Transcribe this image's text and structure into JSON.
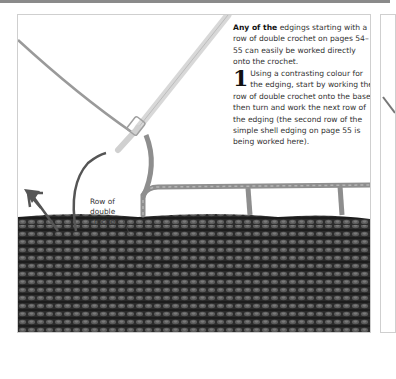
{
  "page": {
    "intro": {
      "lead": "Any of the",
      "rest": " edgings starting with a row of double crochet on pages 54–55 can easily be worked directly onto the crochet."
    },
    "step": {
      "number": "1",
      "text": "Using a contrasting colour for the edging, start by working the row of double crochet onto the base, then turn and work the next row of the edging (the second row of the simple shell edging on page 55 is being worked here)."
    },
    "photo": {
      "label": "Row of double crochet",
      "label_lines": [
        "Row of",
        "double",
        "crochet"
      ],
      "description": "Crochet hook working a chain-space edging onto a dark double crochet fabric"
    },
    "colors": {
      "fabric": "#2e2e2e",
      "edging_yarn": "#8c8c8c",
      "hook": "#d6d6d6",
      "arrow": "#555555"
    }
  }
}
